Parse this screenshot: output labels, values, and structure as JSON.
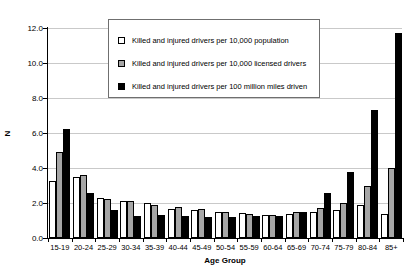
{
  "chart_data": {
    "type": "bar",
    "title": "",
    "xlabel": "Age Group",
    "ylabel": "N",
    "ylim": [
      0.0,
      12.0
    ],
    "yticks": [
      "0.0",
      "2.0",
      "4.0",
      "6.0",
      "8.0",
      "10.0",
      "12.0"
    ],
    "ytick_values": [
      0.0,
      2.0,
      4.0,
      6.0,
      8.0,
      10.0,
      12.0
    ],
    "grid": true,
    "legend_position": "top-center",
    "categories": [
      "15-19",
      "20-24",
      "25-29",
      "30-34",
      "35-39",
      "40-44",
      "45-49",
      "50-54",
      "55-59",
      "60-64",
      "65-69",
      "70-74",
      "75-79",
      "80-84",
      "85+"
    ],
    "series": [
      {
        "name": "Killed and injured drivers per 10,000 population",
        "swatch": "s0",
        "color": "#ffffff",
        "values": [
          3.25,
          3.5,
          2.3,
          2.1,
          2.0,
          1.65,
          1.6,
          1.5,
          1.45,
          1.3,
          1.4,
          1.5,
          1.6,
          1.9,
          1.4
        ]
      },
      {
        "name": "Killed and injured drivers per 10,000 licensed drivers",
        "swatch": "s1",
        "color": "#a6a6a6",
        "values": [
          4.9,
          3.6,
          2.25,
          2.1,
          1.9,
          1.75,
          1.65,
          1.5,
          1.4,
          1.3,
          1.5,
          1.7,
          2.0,
          3.0,
          4.0
        ]
      },
      {
        "name": "Killed and injured drivers per 100 million miles driven",
        "swatch": "s2",
        "color": "#000000",
        "values": [
          6.25,
          2.6,
          1.6,
          1.25,
          1.3,
          1.25,
          1.2,
          1.2,
          1.25,
          1.25,
          1.5,
          2.6,
          3.8,
          7.3,
          11.7
        ]
      }
    ]
  }
}
